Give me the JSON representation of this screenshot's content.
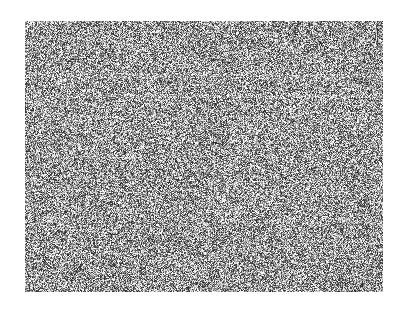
{
  "canvas": {
    "width": 407,
    "height": 315,
    "background_color": "#ffffff"
  },
  "noise_field": {
    "name": "corrupted-image-region",
    "x": 25,
    "y": 21,
    "width": 358,
    "height": 271,
    "grayscale": true,
    "mean_gray": "#9a9a9a",
    "min_gray": "#000000",
    "max_gray": "#ffffff",
    "description": "Full-field high-frequency grayscale salt-and-pepper noise; no legible content",
    "noise_amplitude": 116,
    "pixel_block": 1,
    "seed": 20240517,
    "bands": [
      {
        "name": "seam-upper",
        "y": 53,
        "height": 4,
        "brightness_delta": 16
      },
      {
        "name": "seam-mid-a",
        "y": 74,
        "height": 3,
        "brightness_delta": 20
      },
      {
        "name": "seam-mid-b",
        "y": 95,
        "height": 3,
        "brightness_delta": 14
      },
      {
        "name": "seam-mid-c",
        "y": 118,
        "height": 3,
        "brightness_delta": 12
      },
      {
        "name": "seam-lower",
        "y": 168,
        "height": 3,
        "brightness_delta": 10
      }
    ],
    "texture_rows": [
      {
        "name": "glyph-row-1",
        "y": 22,
        "height": 22,
        "contrast_boost": 22
      },
      {
        "name": "glyph-row-2",
        "y": 46,
        "height": 20,
        "contrast_boost": 16
      },
      {
        "name": "glyph-row-3",
        "y": 96,
        "height": 22,
        "contrast_boost": 18
      },
      {
        "name": "glyph-row-4",
        "y": 120,
        "height": 22,
        "contrast_boost": 20
      },
      {
        "name": "glyph-row-5",
        "y": 146,
        "height": 24,
        "contrast_boost": 24
      },
      {
        "name": "glyph-row-6",
        "y": 186,
        "height": 22,
        "contrast_boost": 14
      }
    ]
  },
  "accessibility": {
    "alt_text": "Unreadable noise-corrupted image"
  }
}
